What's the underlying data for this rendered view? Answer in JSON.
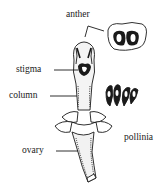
{
  "diagram": {
    "labels": {
      "anther": "anther",
      "stigma": "stigma",
      "column": "column",
      "ovary": "ovary",
      "pollinia": "pollinia"
    },
    "colors": {
      "ink": "#1a1a1a",
      "background": "#ffffff"
    }
  }
}
